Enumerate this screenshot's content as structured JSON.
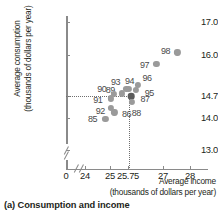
{
  "chart_data": {
    "type": "scatter",
    "title": "",
    "caption": "(a) Consumption and income",
    "xlabel_line1": "Average income",
    "xlabel_line2": "(thousands of dollars per year)",
    "ylabel_line1": "Average consumption",
    "ylabel_line2": "(thousands of dollars per year)",
    "xlim": [
      23.6,
      28.4
    ],
    "ylim": [
      12.85,
      17.25
    ],
    "xticks": [
      "0",
      "24",
      "25",
      "25.75",
      "27",
      "28"
    ],
    "yticks": [
      "17.0",
      "16.0",
      "14.7",
      "14.0",
      "13.0"
    ],
    "axis_break_x": true,
    "axis_break_y": true,
    "grid": false,
    "legend": "none",
    "reference_lines": {
      "x": "25.75",
      "y": "14.7",
      "style": "dotted"
    },
    "points": [
      {
        "label": "85",
        "x": 24.78,
        "y": 13.97,
        "label_dx": -13,
        "label_dy": 0,
        "highlight": false
      },
      {
        "label": "86",
        "x": 25.12,
        "y": 14.18,
        "label_dx": 12,
        "label_dy": 2,
        "highlight": false
      },
      {
        "label": "87",
        "x": 25.75,
        "y": 14.7,
        "label_dx": 14,
        "label_dy": 3,
        "highlight": true
      },
      {
        "label": "88",
        "x": 25.8,
        "y": 14.52,
        "label_dx": 4,
        "label_dy": 11,
        "highlight": false
      },
      {
        "label": "89",
        "x": 25.42,
        "y": 14.78,
        "label_dx": -12,
        "label_dy": -3,
        "highlight": false
      },
      {
        "label": "90",
        "x": 25.1,
        "y": 14.76,
        "label_dx": -12,
        "label_dy": -5,
        "highlight": false
      },
      {
        "label": "91",
        "x": 24.98,
        "y": 14.62,
        "label_dx": -13,
        "label_dy": 2,
        "highlight": false
      },
      {
        "label": "92",
        "x": 25.0,
        "y": 14.33,
        "label_dx": -11,
        "label_dy": 3,
        "highlight": false
      },
      {
        "label": "93",
        "x": 25.58,
        "y": 14.93,
        "label_dx": -11,
        "label_dy": -7,
        "highlight": false
      },
      {
        "label": "94",
        "x": 25.66,
        "y": 14.92,
        "label_dx": 1,
        "label_dy": -8,
        "highlight": false
      },
      {
        "label": "95",
        "x": 25.95,
        "y": 14.88,
        "label_dx": 13,
        "label_dy": 3,
        "highlight": false
      },
      {
        "label": "96",
        "x": 26.02,
        "y": 15.05,
        "label_dx": 9,
        "label_dy": -7,
        "highlight": false
      },
      {
        "label": "97",
        "x": 26.72,
        "y": 15.72,
        "label_dx": -12,
        "label_dy": 1,
        "highlight": false
      },
      {
        "label": "98",
        "x": 27.52,
        "y": 16.08,
        "label_dx": -12,
        "label_dy": -1,
        "highlight": false
      }
    ]
  }
}
